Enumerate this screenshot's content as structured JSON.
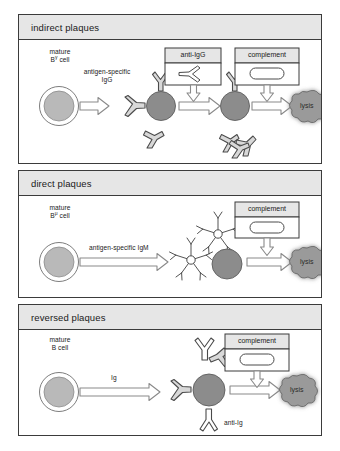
{
  "figure": {
    "panels": [
      {
        "id": "indirect",
        "title": "indirect plaques",
        "cell_label_line1": "mature",
        "cell_label_line2_pre": "B",
        "cell_label_line2_sup": "γ",
        "cell_label_line2_post": " cell",
        "arrow_label_line1": "antigen-specific",
        "arrow_label_line2": "IgG",
        "reagent_box_1": "anti-IgG",
        "reagent_box_2": "complement",
        "outcome": "lysis"
      },
      {
        "id": "direct",
        "title": "direct plaques",
        "cell_label_line1": "mature",
        "cell_label_line2_pre": "B",
        "cell_label_line2_sup": "μ",
        "cell_label_line2_post": " cell",
        "arrow_label_line1": "antigen-specific IgM",
        "arrow_label_line2": "",
        "reagent_box_2": "complement",
        "outcome": "lysis"
      },
      {
        "id": "reversed",
        "title": "reversed plaques",
        "cell_label_line1": "mature",
        "cell_label_line2_pre": "B",
        "cell_label_line2_sup": "",
        "cell_label_line2_post": " cell",
        "arrow_label_line1": "Ig",
        "arrow_label_line2": "",
        "reagent_box_2": "complement",
        "antibody_label": "anti-Ig",
        "outcome": "lysis"
      }
    ]
  },
  "colors": {
    "panel_border": "#3b3b3b",
    "header_band": "#e6e6e6",
    "mature_cell_fill": "#b9b9b9",
    "plasma_cell_fill": "#8c8c8c",
    "lysis_fill": "#9a9a9a",
    "arrow_fill": "#ffffff",
    "arrow_stroke": "#6e6e6e",
    "antibody_fill": "#d8d8d8",
    "antibody_stroke": "#4a4a4a",
    "page_background": "#ffffff"
  }
}
